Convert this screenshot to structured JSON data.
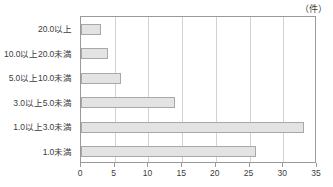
{
  "chart_data": {
    "type": "bar",
    "orientation": "horizontal",
    "title": "",
    "subtitle": "",
    "unit_label": "（件）",
    "xlabel": "",
    "ylabel": "",
    "xlim": [
      0,
      35
    ],
    "xticks": [
      0,
      5,
      10,
      15,
      20,
      25,
      30,
      35
    ],
    "xtick_labels": [
      "0",
      "5",
      "10",
      "15",
      "20",
      "25",
      "30",
      "35"
    ],
    "grid": true,
    "grid_axis": "x",
    "legend": false,
    "legend_position": "none",
    "bar_fill_color": "#e3e3e3",
    "bar_border_color": "#a8a8a8",
    "axis_color": "#9a9a9a",
    "gridline_color": "#d2d2d2",
    "text_color": "#3c3c3c",
    "categories": [
      "20.0以上",
      "10.0以上20.0未満",
      "5.0以上10.0未満",
      "3.0以上5.0未満",
      "1.0以上3.0未満",
      "1.0未満"
    ],
    "values": [
      3,
      4,
      6,
      14,
      33,
      26
    ]
  }
}
